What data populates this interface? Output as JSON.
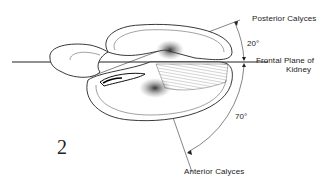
{
  "figure": {
    "number": "2",
    "labels": {
      "posterior": "Posterior Calyces",
      "angle_posterior": "20°",
      "frontal_line1": "Frontal  Plane of",
      "frontal_line2": "Kidney",
      "angle_anterior": "70°",
      "anterior": "Anterior Calyces"
    }
  }
}
